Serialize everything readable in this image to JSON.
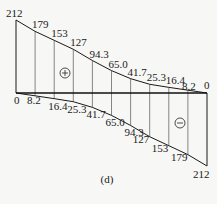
{
  "diagram": {
    "caption": "(d)",
    "positive_sign": "+",
    "negative_sign": "−",
    "positive_values": [
      "212",
      "179",
      "153",
      "127",
      "94.3",
      "65.0",
      "41.7",
      "25.3",
      "16.4",
      "8.2",
      "0"
    ],
    "negative_values": [
      "0",
      "8.2",
      "16.4",
      "25.3",
      "41.7",
      "65.0",
      "94.3",
      "127",
      "153",
      "179",
      "212"
    ],
    "positive_numeric": [
      212,
      179,
      153,
      127,
      94.3,
      65.0,
      41.7,
      25.3,
      16.4,
      8.2,
      0
    ],
    "negative_numeric": [
      0,
      8.2,
      16.4,
      25.3,
      41.7,
      65.0,
      94.3,
      127,
      153,
      179,
      212
    ],
    "colors": {
      "line": "#1a1a1a",
      "background": "#f7f7f5"
    }
  }
}
